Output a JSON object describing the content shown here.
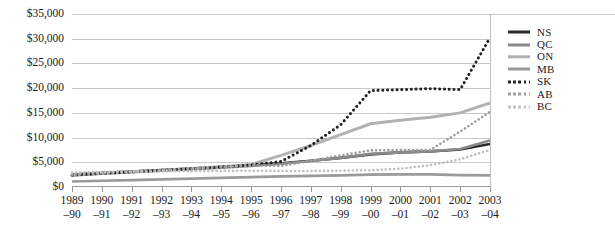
{
  "chart_data": {
    "type": "line",
    "title": "",
    "subtitle": "",
    "xlabel": "",
    "ylabel": "",
    "ylim": [
      0,
      35000
    ],
    "ytick_values": [
      0,
      5000,
      10000,
      15000,
      20000,
      25000,
      30000,
      35000
    ],
    "ytick_labels": [
      "$0",
      "$5,000",
      "$10,000",
      "$15,000",
      "$20,000",
      "$25,000",
      "$30,000",
      "$35,000"
    ],
    "grid": true,
    "grid_axis": "y",
    "legend_position": "right",
    "categories": [
      "1989–90",
      "1990–91",
      "1991–92",
      "1992–93",
      "1993–94",
      "1994–95",
      "1995–96",
      "1996–97",
      "1997–98",
      "1998–99",
      "1999–00",
      "2000–01",
      "2001–02",
      "2002–03",
      "2003–04"
    ],
    "xtick_labels": [
      {
        "line1": "1989",
        "line2": "–90"
      },
      {
        "line1": "1990",
        "line2": "–91"
      },
      {
        "line1": "1991",
        "line2": "–92"
      },
      {
        "line1": "1992",
        "line2": "–93"
      },
      {
        "line1": "1993",
        "line2": "–94"
      },
      {
        "line1": "1994",
        "line2": "–95"
      },
      {
        "line1": "1995",
        "line2": "–96"
      },
      {
        "line1": "1996",
        "line2": "–97"
      },
      {
        "line1": "1997",
        "line2": "–98"
      },
      {
        "line1": "1998",
        "line2": "–99"
      },
      {
        "line1": "1999",
        "line2": "–00"
      },
      {
        "line1": "2000",
        "line2": "–01"
      },
      {
        "line1": "2001",
        "line2": "–02"
      },
      {
        "line1": "2002",
        "line2": "–03"
      },
      {
        "line1": "2003",
        "line2": "–04"
      }
    ],
    "series": [
      {
        "name": "NS",
        "color": "#2b2b2b",
        "style": "solid",
        "width": 2.6,
        "values": [
          2500,
          2850,
          3150,
          3450,
          3750,
          4050,
          4400,
          4800,
          5300,
          5900,
          6600,
          7000,
          7200,
          7600,
          8700
        ]
      },
      {
        "name": "QC",
        "color": "#8a8a8a",
        "style": "solid",
        "width": 2.6,
        "values": [
          2350,
          2700,
          3000,
          3300,
          3600,
          3900,
          4250,
          4700,
          5250,
          5900,
          6700,
          7000,
          7200,
          7700,
          9400
        ]
      },
      {
        "name": "ON",
        "color": "#b2b2b2",
        "style": "solid",
        "width": 3.0,
        "values": [
          2450,
          2800,
          3100,
          3400,
          3750,
          4100,
          4550,
          6400,
          8400,
          10600,
          12800,
          13500,
          14100,
          15000,
          17000
        ]
      },
      {
        "name": "MB",
        "color": "#9a9a9a",
        "style": "solid",
        "width": 2.6,
        "values": [
          1100,
          1250,
          1400,
          1550,
          1700,
          1850,
          2000,
          2150,
          2250,
          2350,
          2500,
          2550,
          2550,
          2400,
          2350
        ]
      },
      {
        "name": "SK",
        "color": "#222222",
        "style": "dotted",
        "width": 3.0,
        "values": [
          2400,
          2750,
          3050,
          3400,
          3700,
          4050,
          4450,
          5150,
          8400,
          12600,
          19500,
          19700,
          19900,
          19700,
          30200
        ]
      },
      {
        "name": "AB",
        "color": "#9e9e9e",
        "style": "dotted",
        "width": 2.6,
        "values": [
          2450,
          2800,
          3100,
          3400,
          3700,
          4050,
          4400,
          4250,
          5300,
          6400,
          7400,
          7500,
          7500,
          11200,
          15200
        ]
      },
      {
        "name": "BC",
        "color": "#c0c0c0",
        "style": "dotted",
        "width": 2.6,
        "values": [
          2900,
          3050,
          3100,
          3150,
          3200,
          3250,
          3300,
          3250,
          3250,
          3300,
          3400,
          3700,
          4400,
          5600,
          7500
        ]
      }
    ]
  },
  "legend": {
    "items": [
      {
        "label": "NS"
      },
      {
        "label": "QC"
      },
      {
        "label": "ON"
      },
      {
        "label": "MB"
      },
      {
        "label": "SK"
      },
      {
        "label": "AB"
      },
      {
        "label": "BC"
      }
    ]
  }
}
